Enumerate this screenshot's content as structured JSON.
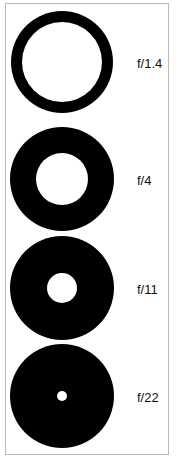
{
  "diagram": {
    "apertures": [
      {
        "label": "f/1.4",
        "cx": 62,
        "cy": 62,
        "outer_r": 51,
        "inner_r": 40
      },
      {
        "label": "f/4",
        "cx": 62,
        "cy": 179,
        "outer_r": 52,
        "inner_r": 26
      },
      {
        "label": "f/11",
        "cx": 62,
        "cy": 288,
        "outer_r": 52,
        "inner_r": 15
      },
      {
        "label": "f/22",
        "cx": 62,
        "cy": 396,
        "outer_r": 52,
        "inner_r": 5
      }
    ],
    "colors": {
      "disc": "#000000",
      "background": "#ffffff",
      "border": "#b8b8b8"
    }
  }
}
